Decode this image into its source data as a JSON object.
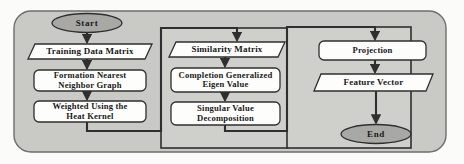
{
  "diagram": {
    "colors": {
      "panel_fill": "#c9c9c6",
      "group_fill": "#cfcfcc",
      "node_fill": "#fdfdfc",
      "terminal_fill": "#a8a8a5",
      "stroke": "#3a3a3a"
    },
    "groups": [
      {
        "id": "group-left",
        "name": "left-stage-group"
      },
      {
        "id": "group-middle",
        "name": "middle-stage-group"
      },
      {
        "id": "group-right",
        "name": "right-stage-group"
      }
    ],
    "nodes": [
      {
        "id": "start",
        "label": "Start",
        "shape": "terminal"
      },
      {
        "id": "training",
        "label": "Training Data Matrix",
        "shape": "parallelogram"
      },
      {
        "id": "formation",
        "label": "Formation Nearest\nNeighbor Graph",
        "shape": "process"
      },
      {
        "id": "weighted",
        "label": "Weighted Using the\nHeat Kernel",
        "shape": "process"
      },
      {
        "id": "similarity",
        "label": "Similarity Matrix",
        "shape": "parallelogram"
      },
      {
        "id": "completion",
        "label": "Completion Generalized\nEigen Value",
        "shape": "process"
      },
      {
        "id": "svd",
        "label": "Singular Value\nDecomposition",
        "shape": "process"
      },
      {
        "id": "projection",
        "label": "Projection",
        "shape": "process"
      },
      {
        "id": "feature",
        "label": "Feature Vector",
        "shape": "parallelogram"
      },
      {
        "id": "end",
        "label": "End",
        "shape": "terminal"
      }
    ],
    "edges": [
      {
        "from": "start",
        "to": "training"
      },
      {
        "from": "training",
        "to": "formation"
      },
      {
        "from": "formation",
        "to": "weighted"
      },
      {
        "from": "weighted",
        "to": "similarity"
      },
      {
        "from": "similarity",
        "to": "completion"
      },
      {
        "from": "completion",
        "to": "svd"
      },
      {
        "from": "svd",
        "to": "projection"
      },
      {
        "from": "projection",
        "to": "feature"
      },
      {
        "from": "feature",
        "to": "end"
      }
    ]
  }
}
